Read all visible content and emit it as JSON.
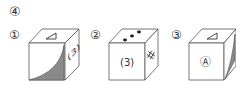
{
  "problem_number": "④",
  "options": [
    {
      "label": "①",
      "top_face": "triangle",
      "front_face": "shaded-curved-triangle",
      "right_face": "(3)",
      "right_face_text": "(3)"
    },
    {
      "label": "②",
      "top_face": "three-dots",
      "front_face": "(3)",
      "front_face_text": "(3)",
      "right_face": "sharp-sign"
    },
    {
      "label": "③",
      "top_face": "triangle",
      "front_face": "circled-A",
      "front_face_text": "Ⓐ",
      "right_face": "shaded-curved-triangle"
    }
  ],
  "colors": {
    "line": "#555555",
    "shade": "#8a8a8a",
    "text": "#333333"
  }
}
